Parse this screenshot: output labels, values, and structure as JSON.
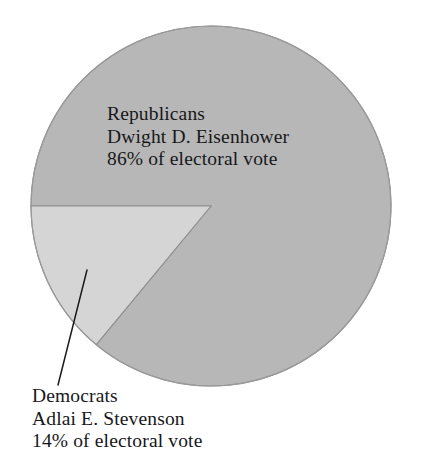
{
  "chart_data": {
    "type": "pie",
    "title": "",
    "subtitle": "",
    "xlabel": "",
    "ylabel": "",
    "legend_position": "none",
    "grid": false,
    "units": "% of electoral vote",
    "categories": [
      "Republicans",
      "Democrats"
    ],
    "values": [
      86,
      14
    ],
    "slices": [
      {
        "name": "Republicans",
        "party": "Republicans",
        "candidate": "Dwight D. Eisenhower",
        "value": 86,
        "value_label": "86% of electoral vote",
        "color": "#b7b7b7",
        "start_angle_deg": 180,
        "sweep_deg": 309.6,
        "label_position": "inside"
      },
      {
        "name": "Democrats",
        "party": "Democrats",
        "candidate": "Adlai E. Stevenson",
        "value": 14,
        "value_label": "14% of electoral vote",
        "color": "#d5d5d5",
        "start_angle_deg": 129.6,
        "sweep_deg": 50.4,
        "label_position": "outside-leader"
      }
    ],
    "annotations": [
      {
        "name": "democrats-leader-line",
        "from": [
          87,
          270
        ],
        "to": [
          58,
          385
        ]
      }
    ]
  },
  "labels": {
    "republicans": {
      "party": "Republicans",
      "candidate": "Dwight D. Eisenhower",
      "share": "86% of electoral vote"
    },
    "democrats": {
      "party": "Democrats",
      "candidate": "Adlai E. Stevenson",
      "share": "14% of electoral vote"
    }
  },
  "style": {
    "background": "#ffffff",
    "text_color": "#17171a",
    "stroke_color": "#8d8d8d",
    "leader_line_color": "#1c1c1c",
    "republican_fill": "#b7b7b7",
    "democrat_fill": "#d5d5d5"
  },
  "geometry": {
    "center_x": 211,
    "center_y": 206,
    "radius": 180
  }
}
